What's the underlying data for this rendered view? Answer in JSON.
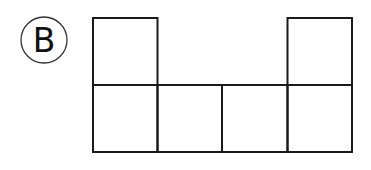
{
  "label": {
    "text": "B",
    "shape": "circle"
  },
  "diagram": {
    "stroke_color": "#1a1a1a",
    "squares": [
      {
        "row": 0,
        "col": 0
      },
      {
        "row": 0,
        "col": 3
      },
      {
        "row": 1,
        "col": 0
      },
      {
        "row": 1,
        "col": 1
      },
      {
        "row": 1,
        "col": 2
      },
      {
        "row": 1,
        "col": 3
      }
    ]
  }
}
